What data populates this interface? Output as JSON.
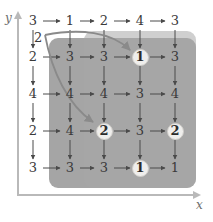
{
  "figure": {
    "type": "grid-diagram",
    "width": 213,
    "height": 222
  },
  "axes": {
    "y_label": "y",
    "x_label": "x",
    "y_axis_icon": "up-arrow-axis",
    "x_axis_icon": "right-arrow-axis",
    "axis_color": "#b9b9b9"
  },
  "chart_data": {
    "type": "table",
    "title": "",
    "xlabel": "x",
    "ylabel": "y",
    "rows": 5,
    "cols": 5,
    "grid_values": [
      [
        "3",
        "1",
        "2",
        "4",
        "3"
      ],
      [
        "2",
        "3",
        "3",
        "1",
        "3"
      ],
      [
        "4",
        "4",
        "4",
        "3",
        "4"
      ],
      [
        "2",
        "4",
        "2",
        "3",
        "2"
      ],
      [
        "3",
        "3",
        "3",
        "1",
        "1"
      ]
    ],
    "circled_cells": [
      {
        "row": 1,
        "col": 3,
        "value": "1"
      },
      {
        "row": 3,
        "col": 2,
        "value": "2"
      },
      {
        "row": 3,
        "col": 4,
        "value": "2"
      },
      {
        "row": 4,
        "col": 3,
        "value": "1"
      }
    ],
    "horizontal_arrows": "every adjacent pair left-to-right in each row",
    "vertical_arrows": "every adjacent pair top-to-bottom in each column",
    "arrow_color": "#4a4a4a"
  },
  "curves": {
    "source_label": "2",
    "color": "#8a8a8a",
    "targets": [
      {
        "row": 1,
        "col": 3,
        "label": "1"
      },
      {
        "row": 3,
        "col": 2,
        "label": "2"
      }
    ]
  },
  "regions": [
    {
      "name": "shaded-region-back",
      "color": "#9d9d9d"
    },
    {
      "name": "shaded-region-front",
      "color": "#a8a8a8"
    }
  ],
  "geometry": {
    "col_x": [
      33,
      70,
      104,
      140,
      175
    ],
    "row_y": [
      21,
      57,
      94,
      131,
      168
    ]
  }
}
